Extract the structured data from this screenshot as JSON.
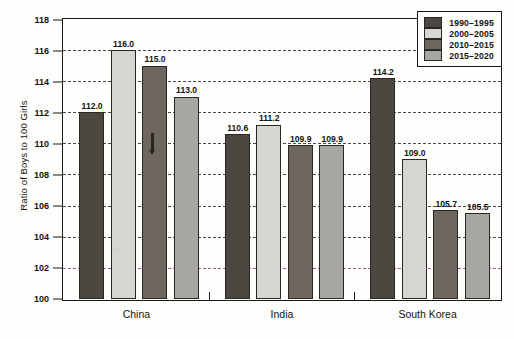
{
  "chart_data": {
    "type": "bar",
    "title": "",
    "xlabel": "",
    "ylabel": "Ratio of Boys to 100 Girls",
    "categories": [
      "China",
      "India",
      "South Korea"
    ],
    "series": [
      {
        "name": "1990–1995",
        "color": "#4c4740",
        "values": [
          112.0,
          110.6,
          114.2
        ]
      },
      {
        "name": "2000–2005",
        "color": "#d6d6d1",
        "values": [
          116.0,
          111.2,
          109.0
        ]
      },
      {
        "name": "2010–2015",
        "color": "#6d6760",
        "values": [
          115.0,
          109.9,
          105.7
        ]
      },
      {
        "name": "2015–2020",
        "color": "#a7a7a1",
        "values": [
          113.0,
          109.9,
          105.5
        ]
      }
    ],
    "data_labels": [
      [
        "112.0",
        "116.0",
        "115.0",
        "113.0"
      ],
      [
        "110.6",
        "111.2",
        "109.9",
        "109.9"
      ],
      [
        "114.2",
        "109.0",
        "105.7",
        "105.5"
      ]
    ],
    "ylim": [
      100,
      118
    ],
    "ytick_step": 2,
    "yticks": [
      "118",
      "116",
      "114",
      "112",
      "110",
      "108",
      "106",
      "104",
      "102",
      "100"
    ],
    "grid": true,
    "grid_style": "dashed",
    "legend_position": "top-right",
    "gridline_accent_value": "102",
    "gridline_accent_color": "#8e2f6b",
    "axis_color": "#1a1814",
    "background_color": "#fdfdfb"
  },
  "legend": {
    "items": [
      {
        "label": "1990–1995",
        "color": "#4c4740"
      },
      {
        "label": "2000–2005",
        "color": "#d6d6d1"
      },
      {
        "label": "2010–2015",
        "color": "#6d6760"
      },
      {
        "label": "2015–2020",
        "color": "#a7a7a1"
      }
    ]
  }
}
